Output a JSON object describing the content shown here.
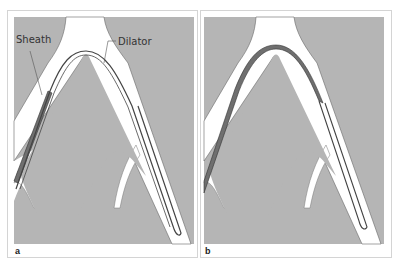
{
  "figure": {
    "panels": [
      {
        "id": "a",
        "label": "a",
        "annotations": {
          "sheath": "Sheath",
          "dilator": "Dilator"
        }
      },
      {
        "id": "b",
        "label": "b"
      }
    ]
  },
  "colors": {
    "background": "#ffffff",
    "tissue": "#b5b5b5",
    "vessel": "#ffffff",
    "sheath": "#6f6f6f",
    "outline": "#444444",
    "border": "#d4d4d4"
  }
}
